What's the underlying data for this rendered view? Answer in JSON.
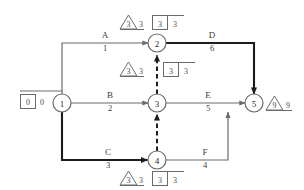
{
  "diagram": {
    "type": "activity-on-arrow-network",
    "nodes": [
      {
        "id": "n1",
        "label": "1",
        "x": 62,
        "y": 103
      },
      {
        "id": "n2",
        "label": "2",
        "x": 157,
        "y": 43
      },
      {
        "id": "n3",
        "label": "3",
        "x": 157,
        "y": 103
      },
      {
        "id": "n4",
        "label": "4",
        "x": 157,
        "y": 160
      },
      {
        "id": "n5",
        "label": "5",
        "x": 254,
        "y": 103
      }
    ],
    "activities": [
      {
        "id": "A",
        "name": "A",
        "duration": "1",
        "from": "1",
        "to": "2",
        "critical": false
      },
      {
        "id": "B",
        "name": "B",
        "duration": "2",
        "from": "1",
        "to": "3",
        "critical": false
      },
      {
        "id": "C",
        "name": "C",
        "duration": "3",
        "from": "1",
        "to": "4",
        "critical": true
      },
      {
        "id": "D",
        "name": "D",
        "duration": "6",
        "from": "2",
        "to": "5",
        "critical": true
      },
      {
        "id": "E",
        "name": "E",
        "duration": "5",
        "from": "3",
        "to": "5",
        "critical": false
      },
      {
        "id": "F",
        "name": "F",
        "duration": "4",
        "from": "4",
        "to": "5",
        "critical": false
      }
    ],
    "dummies": [
      {
        "id": "d43",
        "from": "4",
        "to": "3",
        "style": "dashed",
        "critical": true
      },
      {
        "id": "d32",
        "from": "3",
        "to": "2",
        "style": "dashed",
        "critical": true
      }
    ],
    "annotations": [
      {
        "id": "ann-start",
        "for_node": "1",
        "shape": "square",
        "inner": "0",
        "outer": "0"
      },
      {
        "id": "ann-node2",
        "for_node": "2",
        "triangle_inner": "3",
        "triangle_outer": "3",
        "square_inner": "3",
        "square_outer": "3"
      },
      {
        "id": "ann-node3",
        "for_node": "3",
        "triangle_inner": "3",
        "triangle_outer": "3",
        "square_inner": "3",
        "square_outer": "3"
      },
      {
        "id": "ann-node4",
        "for_node": "4",
        "triangle_inner": "3",
        "triangle_outer": "3",
        "square_inner": "3",
        "square_outer": "3"
      },
      {
        "id": "ann-node5",
        "for_node": "5",
        "shape": "triangle",
        "inner": "9",
        "outer": "9"
      }
    ],
    "colors": {
      "line": "#6b6b6b",
      "critical_line": "#1c1c1c",
      "text": "#3a3a3a",
      "background": "#ffffff"
    }
  }
}
